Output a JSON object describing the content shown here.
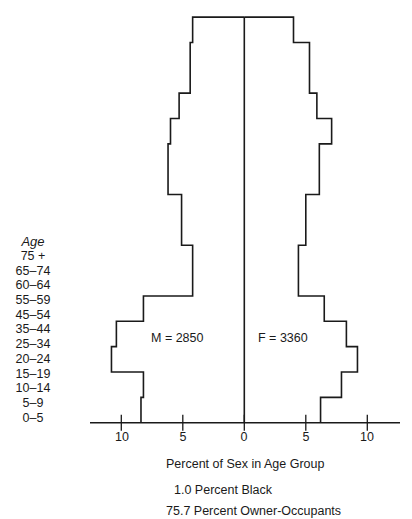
{
  "chart_data": {
    "type": "bar",
    "subtype": "population-pyramid",
    "title": "",
    "xlabel": "Percent of Sex in Age Group",
    "ylabel": "Age",
    "xlim": [
      -12.5,
      12.5
    ],
    "x_ticks": [
      -10,
      -5,
      0,
      5,
      10
    ],
    "x_tick_labels": [
      "10",
      "5",
      "0",
      "5",
      "10"
    ],
    "grid": false,
    "categories": [
      "0–5",
      "5–9",
      "10–14",
      "15–19",
      "20–24",
      "25–34",
      "35–44",
      "45–54",
      "55–59",
      "60–64",
      "65–74",
      "75 +"
    ],
    "category_span_years": [
      5,
      5,
      5,
      5,
      5,
      10,
      10,
      10,
      5,
      5,
      10,
      5
    ],
    "series": [
      {
        "name": "Male",
        "side": "left",
        "total_label": "M = 2850",
        "total": 2850,
        "values": [
          8.4,
          8.2,
          10.8,
          10.4,
          8.2,
          4.2,
          5.1,
          6.2,
          6.0,
          5.3,
          4.4,
          4.2
        ]
      },
      {
        "name": "Female",
        "side": "right",
        "total_label": "F = 3360",
        "total": 3360,
        "values": [
          6.2,
          7.9,
          9.2,
          8.3,
          6.5,
          4.4,
          5.0,
          6.1,
          7.1,
          5.9,
          5.3,
          4.0
        ]
      }
    ],
    "annotations": [
      "1.0 Percent Black",
      "75.7 Percent Owner-Occupants"
    ]
  },
  "age_axis": {
    "title": "Age",
    "labels_top_to_bottom": [
      "75 +",
      "65–74",
      "60–64",
      "55–59",
      "45–54",
      "35–44",
      "25–34",
      "20–24",
      "15–19",
      "10–14",
      "5–9",
      "0–5"
    ]
  },
  "totals": {
    "male": "M = 2850",
    "female": "F = 3360"
  },
  "x_axis": {
    "title": "Percent of Sex in Age Group",
    "ticks": [
      {
        "label": "10",
        "value": -10
      },
      {
        "label": "5",
        "value": -5
      },
      {
        "label": "0",
        "value": 0
      },
      {
        "label": "5",
        "value": 5
      },
      {
        "label": "10",
        "value": 10
      }
    ]
  },
  "stats": {
    "black": "1.0 Percent Black",
    "owner_occupants": "75.7 Percent Owner-Occupants"
  },
  "colors": {
    "line": "#1a1a1a",
    "background": "#ffffff"
  }
}
